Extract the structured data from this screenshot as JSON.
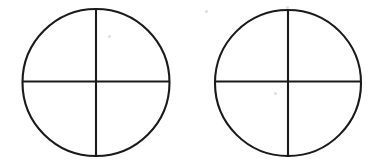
{
  "figure": {
    "canvas": {
      "width": 373,
      "height": 168,
      "background_color": "#ffffff"
    },
    "stroke": {
      "color": "#1a1a1a",
      "circle_width": 2.1,
      "line_width": 2.1
    },
    "shapes": [
      {
        "name": "left-circle",
        "label": "Left quartered circle",
        "cx": 96,
        "cy": 82.5,
        "r": 73.5,
        "divisions": 4,
        "vertical_line": {
          "x": 96,
          "y1": 9,
          "y2": 156
        },
        "horizontal_line": {
          "y": 81.5,
          "x1": 23,
          "x2": 169
        }
      },
      {
        "name": "right-circle",
        "label": "Right quartered circle",
        "cx": 288,
        "cy": 83,
        "r": 73,
        "divisions": 4,
        "vertical_line": {
          "x": 288,
          "y1": 10,
          "y2": 156
        },
        "horizontal_line": {
          "y": 81.5,
          "x1": 215,
          "x2": 361
        }
      }
    ],
    "artifacts": [
      {
        "name": "scan-speck-1",
        "x": 108,
        "y": 35
      },
      {
        "name": "scan-speck-2",
        "x": 205,
        "y": 10
      },
      {
        "name": "scan-speck-3",
        "x": 286,
        "y": 6
      },
      {
        "name": "scan-speck-4",
        "x": 274,
        "y": 92
      }
    ]
  }
}
